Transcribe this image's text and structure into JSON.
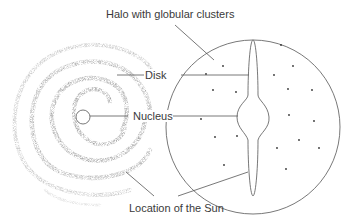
{
  "diagram": {
    "labels": {
      "halo": "Halo with globular clusters",
      "disk": "Disk",
      "nucleus": "Nucleus",
      "sun": "Location of the Sun"
    },
    "views": [
      {
        "name": "face-on spiral view",
        "center": [
          83,
          117
        ]
      },
      {
        "name": "edge-on halo view",
        "center": [
          253,
          127
        ],
        "radius": 87
      }
    ],
    "colors": {
      "line": "#555555",
      "text": "#3a3a3a",
      "spiral": "#777777",
      "cluster_dot": "#333333"
    }
  }
}
